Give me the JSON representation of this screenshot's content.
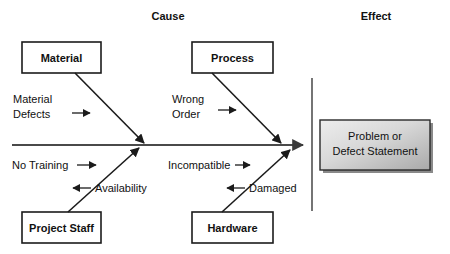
{
  "diagram": {
    "type": "fishbone-ishikawa",
    "headers": {
      "cause": "Cause",
      "effect": "Effect"
    },
    "categories": [
      {
        "id": "material",
        "label": "Material",
        "position": "top-left"
      },
      {
        "id": "process",
        "label": "Process",
        "position": "top-right"
      },
      {
        "id": "project-staff",
        "label": "Project Staff",
        "position": "bottom-left"
      },
      {
        "id": "hardware",
        "label": "Hardware",
        "position": "bottom-right"
      }
    ],
    "causes": [
      {
        "id": "material-defects",
        "label": "Material Defects",
        "lines": [
          "Material",
          "Defects"
        ],
        "category": "material",
        "arrow": "right"
      },
      {
        "id": "wrong-order",
        "label": "Wrong Order",
        "lines": [
          "Wrong",
          "Order"
        ],
        "category": "process",
        "arrow": "right"
      },
      {
        "id": "no-training",
        "label": "No Training",
        "lines": [
          "No Training"
        ],
        "category": "project-staff",
        "arrow": "right"
      },
      {
        "id": "availability",
        "label": "Availability",
        "lines": [
          "Availability"
        ],
        "category": "project-staff",
        "arrow": "left"
      },
      {
        "id": "incompatible",
        "label": "Incompatible",
        "lines": [
          "Incompatible"
        ],
        "category": "hardware",
        "arrow": "right"
      },
      {
        "id": "damaged",
        "label": "Damaged",
        "lines": [
          "Damaged"
        ],
        "category": "hardware",
        "arrow": "left"
      }
    ],
    "effect": {
      "id": "problem-statement",
      "lines": [
        "Problem or",
        "Defect Statement"
      ],
      "label": "Problem or Defect Statement"
    },
    "colors": {
      "background": "#ffffff",
      "line": "#1b1b1b",
      "spine": "#4a4a4a",
      "text": "#111111",
      "effect_fill_light": "#e8e8e8",
      "effect_fill_dark": "#a8a8a8",
      "effect_shadow": "#8a8a8a"
    }
  }
}
